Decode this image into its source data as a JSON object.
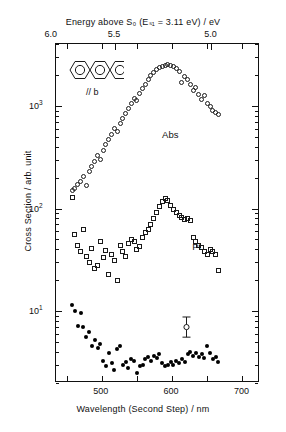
{
  "figure": {
    "top_axis": {
      "title": "Energy above S₀ (Eₛ₁ = 3.11 eV) / eV",
      "ticks": [
        {
          "label": "6.0",
          "value": 6.0
        },
        {
          "label": "5.5",
          "value": 5.5
        },
        {
          "label": "5.0",
          "value": 5.0
        }
      ]
    },
    "bottom_axis": {
      "title": "Wavelength (Second Step) / nm",
      "ticks": [
        {
          "label": "500",
          "value": 500
        },
        {
          "label": "600",
          "value": 600
        },
        {
          "label": "700",
          "value": 700
        }
      ]
    },
    "y_axis": {
      "title": "Cross Section / arb. unit",
      "ticks": [
        {
          "label": "10",
          "exponent": "1",
          "value": 10
        },
        {
          "label": "10",
          "exponent": "2",
          "value": 100
        },
        {
          "label": "10",
          "exponent": "3",
          "value": 1000
        }
      ]
    },
    "annotations": {
      "molecule_name": "anthracene",
      "orientation_label": "// b",
      "abs_label": "Abs",
      "pi_label": "PI"
    },
    "colors": {
      "axis": "#111111",
      "marker": "#1a1a1a",
      "background": "#ffffff"
    }
  },
  "chart_data": {
    "type": "scatter",
    "title": "",
    "xlabel": "Wavelength (Second Step) / nm",
    "ylabel": "Cross Section / arb. unit",
    "x2label": "Energy above S₀ (Eₛ₁ = 3.11 eV) / eV",
    "xlim": [
      435,
      725
    ],
    "ylim": [
      2.0,
      4000
    ],
    "yscale": "log",
    "xscale": "linear",
    "grid": false,
    "legend": "inline-labels",
    "xticks": [
      450,
      500,
      550,
      600,
      650,
      700
    ],
    "xticks_labeled": [
      500,
      600,
      700
    ],
    "x2ticks": [
      6.0,
      5.5,
      5.0
    ],
    "yticks": [
      10,
      100,
      1000
    ],
    "error_bar": {
      "x": 620,
      "y": 7.0,
      "y_low": 5.6,
      "y_high": 8.8,
      "marker": "open-circle"
    },
    "series": [
      {
        "name": "Abs",
        "marker": "open-circle",
        "label_x": 600,
        "label_y": 520,
        "points": [
          [
            458,
            150
          ],
          [
            462,
            158
          ],
          [
            466,
            172
          ],
          [
            470,
            185
          ],
          [
            474,
            205
          ],
          [
            478,
            168
          ],
          [
            482,
            230
          ],
          [
            486,
            258
          ],
          [
            490,
            290
          ],
          [
            494,
            330
          ],
          [
            498,
            300
          ],
          [
            502,
            370
          ],
          [
            506,
            420
          ],
          [
            510,
            470
          ],
          [
            514,
            530
          ],
          [
            518,
            600
          ],
          [
            522,
            560
          ],
          [
            526,
            680
          ],
          [
            530,
            760
          ],
          [
            534,
            850
          ],
          [
            538,
            950
          ],
          [
            542,
            1060
          ],
          [
            546,
            1180
          ],
          [
            550,
            1120
          ],
          [
            554,
            1320
          ],
          [
            558,
            1480
          ],
          [
            562,
            1620
          ],
          [
            566,
            1800
          ],
          [
            570,
            1960
          ],
          [
            574,
            2100
          ],
          [
            578,
            2250
          ],
          [
            582,
            2380
          ],
          [
            586,
            2420
          ],
          [
            590,
            2480
          ],
          [
            594,
            2500
          ],
          [
            598,
            2470
          ],
          [
            602,
            2400
          ],
          [
            606,
            2300
          ],
          [
            610,
            2150
          ],
          [
            614,
            1700
          ],
          [
            618,
            1950
          ],
          [
            622,
            1820
          ],
          [
            626,
            1620
          ],
          [
            630,
            1420
          ],
          [
            634,
            1500
          ],
          [
            638,
            1300
          ],
          [
            642,
            1150
          ],
          [
            646,
            1250
          ],
          [
            650,
            1050
          ],
          [
            654,
            980
          ],
          [
            658,
            900
          ],
          [
            662,
            860
          ],
          [
            666,
            820
          ]
        ]
      },
      {
        "name": "PI",
        "marker": "open-square",
        "label_x": 640,
        "label_y": 42,
        "points": [
          [
            458,
            128
          ],
          [
            462,
            56
          ],
          [
            466,
            44
          ],
          [
            470,
            38
          ],
          [
            474,
            62
          ],
          [
            478,
            34
          ],
          [
            482,
            30
          ],
          [
            486,
            41
          ],
          [
            490,
            26
          ],
          [
            494,
            28
          ],
          [
            498,
            48
          ],
          [
            502,
            33
          ],
          [
            506,
            39
          ],
          [
            510,
            23
          ],
          [
            514,
            36
          ],
          [
            518,
            31
          ],
          [
            522,
            20
          ],
          [
            526,
            44
          ],
          [
            530,
            38
          ],
          [
            534,
            34
          ],
          [
            538,
            46
          ],
          [
            542,
            50
          ],
          [
            546,
            48
          ],
          [
            550,
            40
          ],
          [
            554,
            43
          ],
          [
            558,
            52
          ],
          [
            562,
            58
          ],
          [
            566,
            62
          ],
          [
            570,
            70
          ],
          [
            574,
            80
          ],
          [
            578,
            92
          ],
          [
            582,
            104
          ],
          [
            586,
            118
          ],
          [
            590,
            125
          ],
          [
            594,
            120
          ],
          [
            598,
            108
          ],
          [
            602,
            98
          ],
          [
            606,
            92
          ],
          [
            610,
            86
          ],
          [
            614,
            82
          ],
          [
            618,
            78
          ],
          [
            622,
            80
          ],
          [
            626,
            76
          ],
          [
            630,
            52
          ],
          [
            634,
            48
          ],
          [
            638,
            44
          ],
          [
            642,
            42
          ],
          [
            646,
            38
          ],
          [
            650,
            36
          ],
          [
            654,
            40
          ],
          [
            658,
            38
          ],
          [
            662,
            36
          ],
          [
            666,
            25
          ]
        ]
      },
      {
        "name": "",
        "marker": "filled-circle",
        "label_x": null,
        "label_y": null,
        "points": [
          [
            458,
            11.5
          ],
          [
            462,
            10.0
          ],
          [
            466,
            7.2
          ],
          [
            470,
            9.6
          ],
          [
            474,
            7.0
          ],
          [
            478,
            5.6
          ],
          [
            482,
            6.3
          ],
          [
            486,
            4.6
          ],
          [
            490,
            5.2
          ],
          [
            494,
            4.4
          ],
          [
            498,
            4.8
          ],
          [
            502,
            3.3
          ],
          [
            506,
            2.9
          ],
          [
            510,
            3.9
          ],
          [
            514,
            3.1
          ],
          [
            518,
            2.7
          ],
          [
            522,
            4.3
          ],
          [
            526,
            4.6
          ],
          [
            530,
            3.0
          ],
          [
            534,
            3.2
          ],
          [
            538,
            2.8
          ],
          [
            542,
            3.4
          ],
          [
            546,
            3.3
          ],
          [
            550,
            2.5
          ],
          [
            554,
            2.9
          ],
          [
            558,
            3.0
          ],
          [
            562,
            3.4
          ],
          [
            566,
            3.6
          ],
          [
            570,
            3.3
          ],
          [
            574,
            3.7
          ],
          [
            578,
            3.5
          ],
          [
            582,
            3.8
          ],
          [
            586,
            3.1
          ],
          [
            590,
            2.9
          ],
          [
            594,
            3.0
          ],
          [
            598,
            3.2
          ],
          [
            602,
            3.0
          ],
          [
            606,
            3.3
          ],
          [
            610,
            3.1
          ],
          [
            614,
            3.4
          ],
          [
            618,
            3.2
          ],
          [
            622,
            3.8
          ],
          [
            626,
            4.0
          ],
          [
            630,
            3.7
          ],
          [
            634,
            3.9
          ],
          [
            638,
            3.6
          ],
          [
            642,
            3.8
          ],
          [
            646,
            3.5
          ],
          [
            650,
            4.6
          ],
          [
            654,
            3.9
          ],
          [
            658,
            3.4
          ],
          [
            662,
            3.6
          ],
          [
            666,
            3.2
          ]
        ]
      }
    ]
  }
}
